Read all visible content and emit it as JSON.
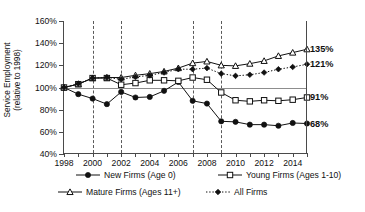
{
  "chart_data": {
    "type": "line",
    "title": "",
    "xlabel": "",
    "ylabel": "Service Employment (relative to 1998)",
    "ylabel_line1": "Service Employment",
    "ylabel_line2": "(relative to 1998)",
    "x": [
      1998,
      1999,
      2000,
      2001,
      2002,
      2003,
      2004,
      2005,
      2006,
      2007,
      2008,
      2009,
      2010,
      2011,
      2012,
      2013,
      2014,
      2015
    ],
    "xlim": [
      1998,
      2015
    ],
    "ylim": [
      40,
      160
    ],
    "ytick_values": [
      40,
      60,
      80,
      100,
      120,
      140,
      160
    ],
    "ytick_labels": [
      "40%",
      "60%",
      "80%",
      "100%",
      "120%",
      "140%",
      "160%"
    ],
    "xtick_values": [
      1998,
      1999,
      2000,
      2001,
      2002,
      2003,
      2004,
      2005,
      2006,
      2007,
      2008,
      2009,
      2010,
      2011,
      2012,
      2013,
      2014,
      2015
    ],
    "xtick_labels": [
      "1998",
      "",
      "2000",
      "",
      "2002",
      "",
      "2004",
      "",
      "2006",
      "",
      "2008",
      "",
      "2010",
      "",
      "2012",
      "",
      "2014",
      ""
    ],
    "grid": false,
    "reference_line": 100,
    "recession_lines": [
      2000,
      2002,
      2007,
      2009
    ],
    "legend_position": "bottom",
    "series": [
      {
        "name": "New Firms (Age 0)",
        "marker": "filled-circle",
        "line": "solid",
        "end_label": "68%",
        "values": [
          100,
          94,
          90,
          85,
          96,
          91,
          91.5,
          97,
          105,
          88,
          85.5,
          69.5,
          69,
          66.5,
          66.5,
          65.5,
          68,
          67.5
        ]
      },
      {
        "name": "Young Firms (Ages 1-10)",
        "marker": "open-square",
        "line": "solid",
        "end_label": "91%",
        "values": [
          100,
          103,
          108.5,
          108.5,
          102.5,
          104,
          106.5,
          106.5,
          106,
          109,
          107,
          95.5,
          88.5,
          87.5,
          88.5,
          88,
          89,
          91
        ]
      },
      {
        "name": "Mature Firms (Ages 11+)",
        "marker": "open-triangle",
        "line": "solid",
        "end_label": "135%",
        "values": [
          100,
          103,
          108.5,
          109,
          109,
          111,
          112.5,
          114.5,
          117.5,
          122,
          123.5,
          120,
          119.5,
          121.5,
          124,
          128.5,
          131.5,
          134.5
        ]
      },
      {
        "name": "All Firms",
        "marker": "filled-diamond",
        "line": "dotted",
        "end_label": "121%",
        "values": [
          100,
          103.5,
          108.5,
          109,
          107.5,
          109.5,
          111,
          113.5,
          116.5,
          116.5,
          117.5,
          112.5,
          110.5,
          111.5,
          113.5,
          116.5,
          118.5,
          121
        ]
      }
    ]
  },
  "legend": {
    "items": [
      {
        "label": "New Firms (Age 0)",
        "marker": "filled-circle"
      },
      {
        "label": "Young Firms (Ages 1-10)",
        "marker": "open-square"
      },
      {
        "label": "Mature Firms (Ages 11+)",
        "marker": "open-triangle"
      },
      {
        "label": "All Firms",
        "marker": "filled-diamond"
      }
    ]
  }
}
